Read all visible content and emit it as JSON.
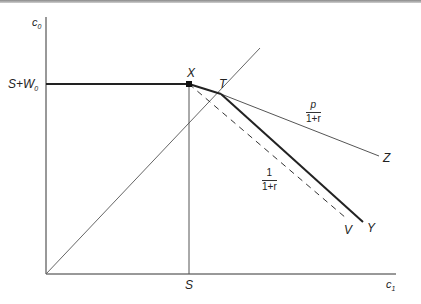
{
  "diagram": {
    "axes": {
      "y_label": "c",
      "y_label_sub": "0",
      "x_label": "c",
      "x_label_sub": "1"
    },
    "ticks": {
      "y_tick": "S+W",
      "y_tick_sub": "0",
      "x_tick": "S"
    },
    "points": {
      "X": "X",
      "T": "T",
      "Z": "Z",
      "Y": "Y",
      "V": "V"
    },
    "slopes": {
      "upper_num": "p",
      "upper_den": "1+r",
      "lower_num": "1",
      "lower_den": "1+r"
    },
    "colors": {
      "axis": "#333333",
      "thin_line": "#555555",
      "thick_line": "#222222"
    }
  }
}
